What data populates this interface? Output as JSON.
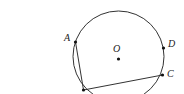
{
  "diagram": {
    "type": "circle-geometry",
    "circle": {
      "center_label": "O",
      "cx": 118.5,
      "cy": 59,
      "r": 45
    },
    "points": [
      {
        "label": "A",
        "x": 75.5,
        "y": 42
      },
      {
        "label": "D",
        "x": 163.5,
        "y": 48
      },
      {
        "label": "C",
        "x": 162.5,
        "y": 75
      },
      {
        "label": "",
        "x": 83.5,
        "y": 90
      }
    ],
    "segments": [
      [
        "A",
        "B"
      ],
      [
        "B",
        "C"
      ]
    ],
    "colors": {
      "stroke": "#333333",
      "point": "#111111"
    }
  },
  "labels": {
    "a": "A",
    "o": "O",
    "d": "D",
    "c": "C"
  }
}
